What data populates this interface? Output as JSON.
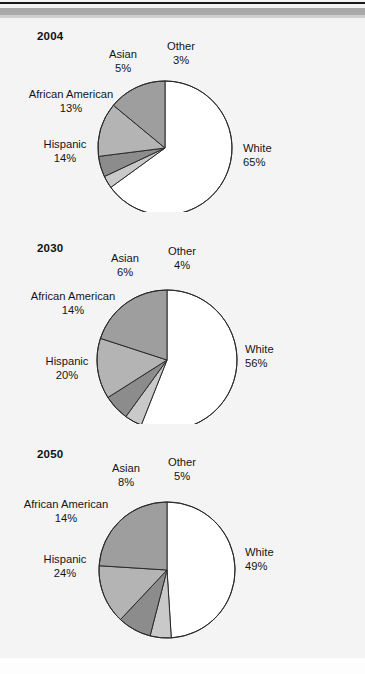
{
  "figure": {
    "background_color": "#f4f4f4",
    "rule_color_dark": "#1a1a1a",
    "rule_color_gray": "#a9a9a9"
  },
  "chart_data": [
    {
      "type": "pie",
      "title": "2004",
      "categories": [
        "White",
        "Other",
        "Asian",
        "African American",
        "Hispanic"
      ],
      "values": [
        65,
        3,
        5,
        13,
        14
      ],
      "labels": [
        "65%",
        "3%",
        "5%",
        "13%",
        "14%"
      ],
      "colors": [
        "#ffffff",
        "#c9c9c9",
        "#8c8c8c",
        "#b4b4b4",
        "#9e9e9e"
      ],
      "start_angle": 0,
      "direction": "clockwise",
      "legend": "none",
      "grid": false
    },
    {
      "type": "pie",
      "title": "2030",
      "categories": [
        "White",
        "Other",
        "Asian",
        "African American",
        "Hispanic"
      ],
      "values": [
        56,
        4,
        6,
        14,
        20
      ],
      "labels": [
        "56%",
        "4%",
        "6%",
        "14%",
        "20%"
      ],
      "colors": [
        "#ffffff",
        "#c9c9c9",
        "#8c8c8c",
        "#b4b4b4",
        "#9e9e9e"
      ],
      "start_angle": 0,
      "direction": "clockwise",
      "legend": "none",
      "grid": false
    },
    {
      "type": "pie",
      "title": "2050",
      "categories": [
        "White",
        "Other",
        "Asian",
        "African American",
        "Hispanic"
      ],
      "values": [
        49,
        5,
        8,
        14,
        24
      ],
      "labels": [
        "49%",
        "5%",
        "8%",
        "14%",
        "24%"
      ],
      "colors": [
        "#ffffff",
        "#c9c9c9",
        "#8c8c8c",
        "#b4b4b4",
        "#9e9e9e"
      ],
      "start_angle": 0,
      "direction": "clockwise",
      "legend": "none",
      "grid": false
    }
  ],
  "panels": [
    {
      "year": "2004",
      "cx": 165,
      "cy": 148,
      "r": 67,
      "slices": [
        {
          "name": "White",
          "value": 65,
          "color": "#ffffff"
        },
        {
          "name": "Other",
          "value": 3,
          "color": "#c9c9c9"
        },
        {
          "name": "Asian",
          "value": 5,
          "color": "#8c8c8c"
        },
        {
          "name": "African American",
          "value": 13,
          "color": "#b4b4b4"
        },
        {
          "name": "Hispanic",
          "value": 14,
          "color": "#9e9e9e"
        }
      ],
      "callouts": {
        "white": {
          "name": "White",
          "pct": "65%"
        },
        "other": {
          "name": "Other",
          "pct": "3%"
        },
        "asian": {
          "name": "Asian",
          "pct": "5%"
        },
        "african": {
          "name": "African American",
          "pct": "13%"
        },
        "hisp": {
          "name": "Hispanic",
          "pct": "14%"
        }
      }
    },
    {
      "year": "2030",
      "cx": 167,
      "cy": 360,
      "r": 70,
      "slices": [
        {
          "name": "White",
          "value": 56,
          "color": "#ffffff"
        },
        {
          "name": "Other",
          "value": 4,
          "color": "#c9c9c9"
        },
        {
          "name": "Asian",
          "value": 6,
          "color": "#8c8c8c"
        },
        {
          "name": "African American",
          "value": 14,
          "color": "#b4b4b4"
        },
        {
          "name": "Hispanic",
          "value": 20,
          "color": "#9e9e9e"
        }
      ],
      "callouts": {
        "white": {
          "name": "White",
          "pct": "56%"
        },
        "other": {
          "name": "Other",
          "pct": "4%"
        },
        "asian": {
          "name": "Asian",
          "pct": "6%"
        },
        "african": {
          "name": "African American",
          "pct": "14%"
        },
        "hisp": {
          "name": "Hispanic",
          "pct": "20%"
        }
      }
    },
    {
      "year": "2050",
      "cx": 167,
      "cy": 570,
      "r": 68,
      "slices": [
        {
          "name": "White",
          "value": 49,
          "color": "#ffffff"
        },
        {
          "name": "Other",
          "value": 5,
          "color": "#c9c9c9"
        },
        {
          "name": "Asian",
          "value": 8,
          "color": "#8c8c8c"
        },
        {
          "name": "African American",
          "value": 14,
          "color": "#b4b4b4"
        },
        {
          "name": "Hispanic",
          "value": 24,
          "color": "#9e9e9e"
        }
      ],
      "callouts": {
        "white": {
          "name": "White",
          "pct": "49%"
        },
        "other": {
          "name": "Other",
          "pct": "5%"
        },
        "asian": {
          "name": "Asian",
          "pct": "8%"
        },
        "african": {
          "name": "African American",
          "pct": "14%"
        },
        "hisp": {
          "name": "Hispanic",
          "pct": "24%"
        }
      }
    }
  ]
}
